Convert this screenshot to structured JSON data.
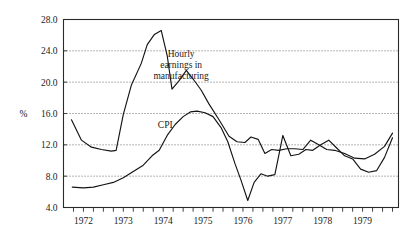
{
  "chart_data": {
    "type": "line",
    "title": "",
    "subtitle": "",
    "xlabel": "",
    "ylabel": "%",
    "ylim": [
      4.0,
      28.0
    ],
    "xlim": [
      1971.5,
      1979.9
    ],
    "grid": true,
    "gridlines_y": [
      8.0,
      12.0,
      16.0,
      20.0,
      24.0
    ],
    "legend_position": "inline-annotation",
    "ytick_labels": [
      "4.0",
      "8.0",
      "12.0",
      "16.0",
      "20.0",
      "24.0",
      "28.0"
    ],
    "ytick_values": [
      4.0,
      8.0,
      12.0,
      16.0,
      20.0,
      24.0,
      28.0
    ],
    "xtick_labels": [
      "1972",
      "1973",
      "1974",
      "1975",
      "1976",
      "1977",
      "1978",
      "1979"
    ],
    "xtick_values": [
      1972,
      1973,
      1974,
      1975,
      1976,
      1977,
      1978,
      1979
    ],
    "x_minor_tick_interval": 0.25,
    "annotations": [
      {
        "name": "hourly-earnings-label",
        "text_lines": [
          "Hourly",
          "earnings in",
          "manufacturing"
        ],
        "x": 1974.45,
        "y": 23.2
      },
      {
        "name": "cpi-label",
        "text_lines": [
          "CPI"
        ],
        "x": 1974.05,
        "y": 14.1
      }
    ],
    "series": [
      {
        "name": "Hourly earnings in manufacturing",
        "color": "#141414",
        "x": [
          1971.7,
          1971.95,
          1972.2,
          1972.45,
          1972.7,
          1972.82,
          1973.0,
          1973.2,
          1973.45,
          1973.6,
          1973.78,
          1973.95,
          1974.1,
          1974.22,
          1974.4,
          1974.58,
          1974.75,
          1974.95,
          1975.15,
          1975.4,
          1975.65,
          1975.85,
          1976.05,
          1976.2,
          1976.38,
          1976.55,
          1976.72,
          1976.9,
          1977.1,
          1977.3,
          1977.5,
          1977.7,
          1977.9,
          1978.1,
          1978.3,
          1978.55,
          1978.8,
          1979.05,
          1979.3,
          1979.55,
          1979.75
        ],
        "values": [
          15.2,
          12.6,
          11.7,
          11.4,
          11.2,
          11.3,
          15.9,
          19.6,
          22.4,
          24.8,
          26.1,
          26.6,
          23.4,
          19.1,
          20.2,
          21.5,
          20.4,
          19.0,
          17.2,
          15.2,
          13.1,
          12.4,
          12.3,
          13.0,
          12.7,
          10.9,
          11.4,
          11.3,
          11.5,
          11.5,
          11.4,
          12.6,
          12.0,
          11.4,
          11.3,
          10.9,
          10.3,
          10.2,
          10.8,
          11.8,
          13.5
        ]
      },
      {
        "name": "CPI",
        "color": "#141414",
        "x": [
          1971.72,
          1972.0,
          1972.25,
          1972.5,
          1972.75,
          1973.0,
          1973.25,
          1973.5,
          1973.72,
          1973.9,
          1974.1,
          1974.3,
          1974.5,
          1974.68,
          1974.85,
          1975.05,
          1975.25,
          1975.45,
          1975.62,
          1975.8,
          1975.95,
          1976.12,
          1976.28,
          1976.45,
          1976.62,
          1976.8,
          1977.0,
          1977.2,
          1977.4,
          1977.58,
          1977.75,
          1977.95,
          1978.15,
          1978.35,
          1978.55,
          1978.75,
          1978.95,
          1979.15,
          1979.35,
          1979.55,
          1979.75
        ],
        "values": [
          6.6,
          6.5,
          6.6,
          6.9,
          7.2,
          7.8,
          8.6,
          9.4,
          10.6,
          11.3,
          13.2,
          14.6,
          15.6,
          16.2,
          16.3,
          16.1,
          15.6,
          14.2,
          12.4,
          9.6,
          7.5,
          4.9,
          7.2,
          8.3,
          8.0,
          8.2,
          13.2,
          10.6,
          10.8,
          11.4,
          11.3,
          12.0,
          12.6,
          11.6,
          10.6,
          10.2,
          8.9,
          8.5,
          8.7,
          10.4,
          12.9
        ]
      }
    ]
  }
}
